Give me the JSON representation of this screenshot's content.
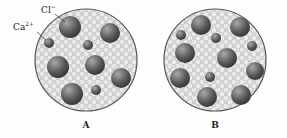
{
  "labels": {
    "chloride": {
      "base": "Cl",
      "charge": "−"
    },
    "calcium": {
      "base": "Ca",
      "charge": "2+"
    }
  },
  "panels": [
    {
      "caption": "A",
      "cx": 86,
      "cy": 60,
      "r": 51,
      "anions": [
        [
          70,
          27,
          11
        ],
        [
          110,
          33,
          10
        ],
        [
          58,
          67,
          11
        ],
        [
          95,
          65,
          10
        ],
        [
          121,
          78,
          10
        ],
        [
          72,
          94,
          11
        ]
      ],
      "cations": [
        [
          49,
          43,
          5
        ],
        [
          88,
          45,
          5
        ],
        [
          96,
          90,
          5
        ]
      ]
    },
    {
      "caption": "B",
      "cx": 215,
      "cy": 60,
      "r": 51,
      "anions": [
        [
          201,
          25,
          10
        ],
        [
          240,
          27,
          10
        ],
        [
          185,
          53,
          10
        ],
        [
          227,
          58,
          10
        ],
        [
          255,
          71,
          9
        ],
        [
          180,
          78,
          10
        ],
        [
          207,
          97,
          10
        ],
        [
          241,
          95,
          10
        ]
      ],
      "cations": [
        [
          181,
          35,
          5
        ],
        [
          216,
          38,
          5
        ],
        [
          252,
          46,
          5
        ],
        [
          210,
          77,
          5
        ]
      ]
    }
  ],
  "colors": {
    "ion_dark": "#3a3a3a",
    "ion_light": "#9a9a9a",
    "water": "#d6d6d6",
    "outline": "#555555"
  }
}
